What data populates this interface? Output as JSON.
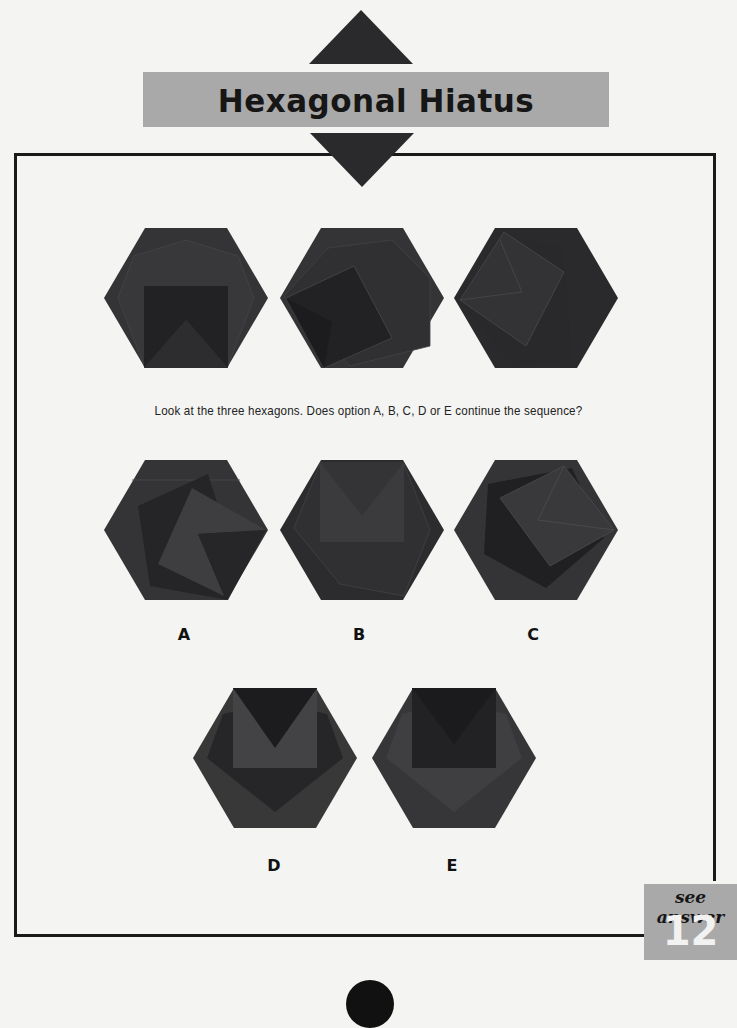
{
  "title": "Hexagonal Hiatus",
  "question": "Look at the three hexagons. Does option A, B, C, D or E continue the sequence?",
  "sequence": [
    {
      "name": "sequence-hexagon-1",
      "square_rotation_deg": 0
    },
    {
      "name": "sequence-hexagon-2",
      "square_rotation_deg": 20
    },
    {
      "name": "sequence-hexagon-3",
      "square_rotation_deg": 40
    }
  ],
  "options": [
    {
      "label": "A",
      "square_rotation_deg": 60
    },
    {
      "label": "B",
      "square_rotation_deg": 0
    },
    {
      "label": "C",
      "square_rotation_deg": 60
    },
    {
      "label": "D",
      "square_rotation_deg": 0
    },
    {
      "label": "E",
      "square_rotation_deg": 0
    }
  ],
  "answer_ref": {
    "text": "see answer",
    "number": "12"
  },
  "colors": {
    "hexagon": "#343436",
    "dark_shape": "#1f1f21",
    "mid_shape": "#3e3e40",
    "light_shape": "#47474a",
    "band": "#a9a9a9",
    "frame": "#1a1a1a"
  }
}
